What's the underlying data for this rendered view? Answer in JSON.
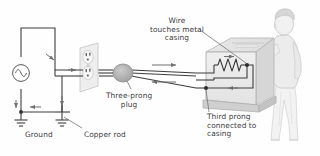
{
  "figure": {
    "background_color": "#fefefe",
    "ink_color": "#3d3d3d"
  },
  "labels": {
    "ground": "Ground",
    "copper_rod": "Copper rod",
    "three_prong_plug": "Three-prong\nplug",
    "wire_touches_casing": "Wire\ntouches metal\ncasing",
    "third_prong": "Third prong\nconnected to\ncasing"
  },
  "components": {
    "ac_source": "ac-source-symbol",
    "ground_symbol_left": "earth-ground-symbol",
    "ground_symbol_right": "earth-ground-symbol",
    "outlet": "wall-outlet-duplex",
    "plug": "three-prong-plug-body",
    "appliance": "metal-cased-appliance",
    "heating_element": "resistor-zigzag",
    "person": "person-figure"
  },
  "colors": {
    "wire": "#3d3d3d",
    "outlet_plate": "#eceaea",
    "appliance_face": "#ececec",
    "appliance_top": "#e2e2e2",
    "appliance_side": "#d9d9d9",
    "plug_body": "#b9b9b9",
    "person": "#ededed",
    "arrow": "#7a7a7a"
  }
}
